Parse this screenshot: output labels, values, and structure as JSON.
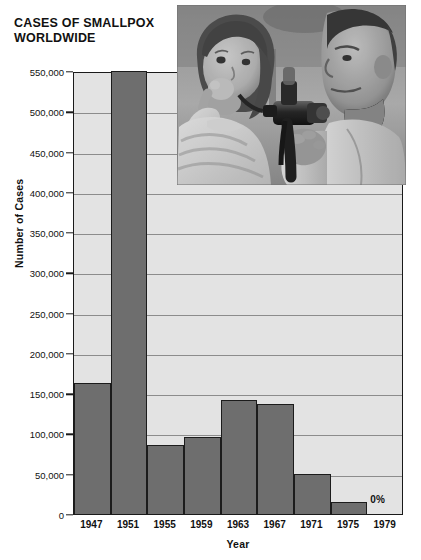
{
  "chart_data": {
    "type": "bar",
    "title": "CASES OF SMALLPOX WORLDWIDE",
    "title_line1": "CASES OF SMALLPOX",
    "title_line2": "WORLDWIDE",
    "xlabel": "Year",
    "ylabel": "Number of Cases",
    "categories": [
      "1947",
      "1951",
      "1955",
      "1959",
      "1963",
      "1967",
      "1971",
      "1975",
      "1979"
    ],
    "values": [
      163000,
      550000,
      86000,
      95000,
      142000,
      136000,
      50000,
      15000,
      0
    ],
    "ylim": [
      0,
      550000
    ],
    "yticks": [
      0,
      50000,
      100000,
      150000,
      200000,
      250000,
      300000,
      350000,
      400000,
      450000,
      500000,
      550000
    ],
    "ytick_labels": [
      "0",
      "50,000",
      "100,000",
      "150,000",
      "200,000",
      "250,000",
      "300,000",
      "350,000",
      "400,000",
      "450,000",
      "500,000",
      "550,000"
    ],
    "grid": true,
    "legend": "none",
    "bar_color": "#6e6e6e",
    "plot_background": "#e3e3e3",
    "gridline_color": "#8c8c8c",
    "axis_color": "#1a1a1a",
    "annotations": [
      {
        "text": "0%",
        "category": "1979"
      }
    ]
  },
  "photo": {
    "caption_alt": "Black-and-white photograph of a doctor vaccinating a young girl with a jet injector"
  }
}
